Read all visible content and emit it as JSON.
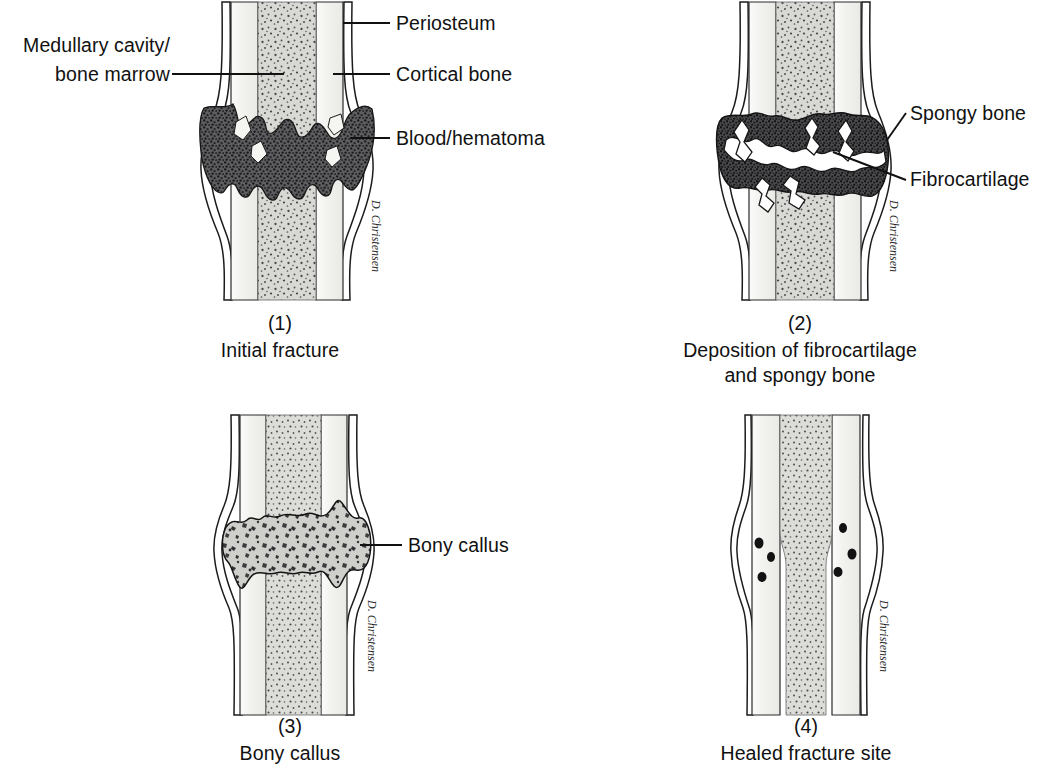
{
  "figure": {
    "style": "black-and-white medical line illustration, stippled shading",
    "artist_signature": "D. Christensen",
    "colors": {
      "ink": "#111111",
      "marrow_fill": "#d6d6d2",
      "marrow_stipple": "#4a4a4a",
      "cortical_fill": "#f2f2ef",
      "hematoma_fill": "#58585a",
      "hematoma_stipple": "#1e1e1e",
      "spongy_fill": "#3c3c3e",
      "callus_fill": "#c9c9c5",
      "background": "#ffffff"
    }
  },
  "panels": [
    {
      "id": "panel-1",
      "number": "(1)",
      "caption_lines": [
        "Initial fracture"
      ],
      "labels": [
        {
          "name": "periosteum",
          "text": "Periosteum",
          "side": "right"
        },
        {
          "name": "cortical-bone",
          "text": "Cortical bone",
          "side": "right"
        },
        {
          "name": "blood-hematoma",
          "text": "Blood/hematoma",
          "side": "right"
        },
        {
          "name": "medullary-cavity",
          "text": "Medullary cavity/",
          "side": "left"
        },
        {
          "name": "bone-marrow",
          "text": "bone marrow",
          "side": "left"
        }
      ]
    },
    {
      "id": "panel-2",
      "number": "(2)",
      "caption_lines": [
        "Deposition of fibrocartilage",
        "and spongy bone"
      ],
      "labels": [
        {
          "name": "spongy-bone",
          "text": "Spongy bone",
          "side": "right"
        },
        {
          "name": "fibrocartilage",
          "text": "Fibrocartilage",
          "side": "right"
        }
      ]
    },
    {
      "id": "panel-3",
      "number": "(3)",
      "caption_lines": [
        "Bony callus"
      ],
      "labels": [
        {
          "name": "bony-callus",
          "text": "Bony callus",
          "side": "right"
        }
      ]
    },
    {
      "id": "panel-4",
      "number": "(4)",
      "caption_lines": [
        "Healed fracture site"
      ],
      "labels": []
    }
  ]
}
